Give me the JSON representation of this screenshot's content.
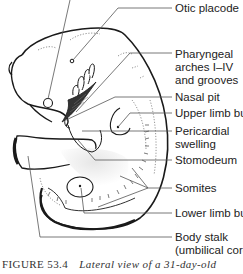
{
  "diagram": {
    "labels": [
      {
        "id": "otic-placode",
        "text": "Otic placode"
      },
      {
        "id": "pharyngeal-arches",
        "text": "Pharyngeal",
        "line2": "arches I–IV",
        "line3": "and grooves"
      },
      {
        "id": "nasal-pit",
        "text": "Nasal pit"
      },
      {
        "id": "upper-limb-bud",
        "text": "Upper limb bud"
      },
      {
        "id": "pericardial-swelling",
        "text": "Pericardial",
        "line2": "swelling"
      },
      {
        "id": "stomodeum",
        "text": "Stomodeum"
      },
      {
        "id": "somites",
        "text": "Somites"
      },
      {
        "id": "lower-limb-bud",
        "text": "Lower limb bud"
      },
      {
        "id": "body-stalk",
        "text": "Body stalk",
        "line2": "(umbilical cord)"
      }
    ],
    "colors": {
      "outline": "#1a1a1a",
      "leader_line": "#555555",
      "shading": "#c8c8c8"
    }
  },
  "caption": {
    "number": "FIGURE 53.4",
    "text": "Lateral view of a 31-day-old"
  }
}
